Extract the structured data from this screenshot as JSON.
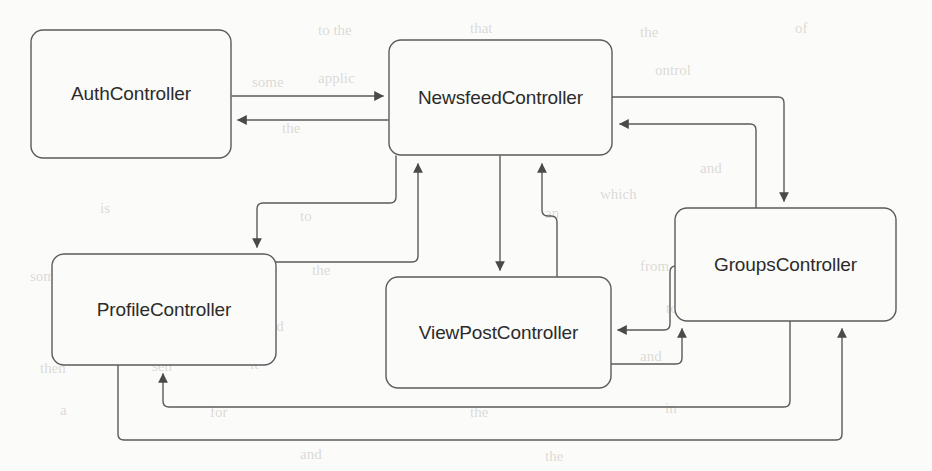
{
  "diagram": {
    "type": "flow-diagram",
    "canvas": {
      "width": 932,
      "height": 471,
      "background": "#fbfbf9"
    },
    "style": {
      "node_fill": "#fbfbf9",
      "node_stroke": "#5b5b5b",
      "edge_stroke": "#5b5b5b",
      "text_color": "#2b2b2b",
      "corner_radius": 12
    },
    "nodes": [
      {
        "id": "auth",
        "label": "AuthController",
        "x": 31,
        "y": 30,
        "w": 200,
        "h": 128
      },
      {
        "id": "newsfeed",
        "label": "NewsfeedController",
        "x": 389,
        "y": 40,
        "w": 223,
        "h": 115
      },
      {
        "id": "groups",
        "label": "GroupsController",
        "x": 675,
        "y": 208,
        "w": 221,
        "h": 113
      },
      {
        "id": "profile",
        "label": "ProfileController",
        "x": 52,
        "y": 254,
        "w": 224,
        "h": 111
      },
      {
        "id": "viewpost",
        "label": "ViewPostController",
        "x": 386,
        "y": 277,
        "w": 225,
        "h": 111
      }
    ],
    "edges": [
      {
        "id": "auth-to-newsfeed",
        "from": "auth",
        "to": "newsfeed",
        "path": "M 232 96 L 383 96",
        "arrow_at": "end"
      },
      {
        "id": "newsfeed-to-auth",
        "from": "newsfeed",
        "to": "auth",
        "path": "M 388 120 L 238 120",
        "arrow_at": "end"
      },
      {
        "id": "newsfeed-to-profile",
        "from": "newsfeed",
        "to": "profile",
        "path": "M 396 156 L 396 197 Q 396 203 390 203 L 263 203 Q 257 203 257 209 L 257 247",
        "arrow_at": "end"
      },
      {
        "id": "profile-to-newsfeed",
        "from": "profile",
        "to": "newsfeed",
        "path": "M 276 262 L 412 262 Q 418 262 418 256 L 418 164",
        "arrow_at": "end"
      },
      {
        "id": "newsfeed-to-viewpost",
        "from": "newsfeed",
        "to": "viewpost",
        "path": "M 500 156 L 500 270",
        "arrow_at": "end"
      },
      {
        "id": "viewpost-to-newsfeed",
        "from": "viewpost",
        "to": "newsfeed",
        "path": "M 557 277 L 557 222 Q 557 216 551 216 L 548 216 Q 542 216 542 210 L 542 164",
        "arrow_at": "end"
      },
      {
        "id": "newsfeed-to-groups",
        "from": "newsfeed",
        "to": "groups",
        "path": "M 612 97 L 778 97 Q 784 97 784 103 L 784 201",
        "arrow_at": "end"
      },
      {
        "id": "groups-to-newsfeed",
        "from": "groups",
        "to": "newsfeed",
        "path": "M 756 208 L 756 130 Q 756 124 750 124 L 620 124",
        "arrow_at": "end"
      },
      {
        "id": "groups-to-viewpost",
        "from": "groups",
        "to": "viewpost",
        "path": "M 676 266 Q 670 266 670 272 L 670 324 Q 670 330 664 330 L 618 330",
        "arrow_at": "end"
      },
      {
        "id": "viewpost-to-groups",
        "from": "viewpost",
        "to": "groups",
        "path": "M 611 364 L 676 364 Q 682 364 682 358 L 682 329",
        "arrow_at": "end"
      },
      {
        "id": "groups-to-profile",
        "from": "groups",
        "to": "profile",
        "path": "M 790 321 L 790 401 Q 790 407 784 407 L 169 407 Q 163 407 163 401 L 163 374",
        "arrow_at": "end"
      },
      {
        "id": "profile-to-groups",
        "from": "profile",
        "to": "groups",
        "path": "M 118 365 L 118 434 Q 118 440 124 440 L 836 440 Q 842 440 842 434 L 842 329",
        "arrow_at": "end"
      }
    ],
    "background_text": [
      {
        "t": "to the",
        "x": 318,
        "y": 22
      },
      {
        "t": "that",
        "x": 470,
        "y": 20
      },
      {
        "t": "the",
        "x": 640,
        "y": 24
      },
      {
        "t": "of",
        "x": 795,
        "y": 20
      },
      {
        "t": "some",
        "x": 252,
        "y": 74
      },
      {
        "t": "applic",
        "x": 318,
        "y": 70
      },
      {
        "t": "a num",
        "x": 470,
        "y": 68
      },
      {
        "t": "ontrol",
        "x": 655,
        "y": 62
      },
      {
        "t": "the",
        "x": 282,
        "y": 120
      },
      {
        "t": "user",
        "x": 430,
        "y": 118
      },
      {
        "t": "the",
        "x": 560,
        "y": 114
      },
      {
        "t": "and",
        "x": 700,
        "y": 160
      },
      {
        "t": "is",
        "x": 100,
        "y": 200
      },
      {
        "t": "to",
        "x": 300,
        "y": 208
      },
      {
        "t": "an",
        "x": 545,
        "y": 205
      },
      {
        "t": "which",
        "x": 600,
        "y": 186
      },
      {
        "t": "some",
        "x": 30,
        "y": 268
      },
      {
        "t": "the",
        "x": 312,
        "y": 262
      },
      {
        "t": "from",
        "x": 640,
        "y": 258
      },
      {
        "t": "the",
        "x": 108,
        "y": 312
      },
      {
        "t": "sh",
        "x": 200,
        "y": 318
      },
      {
        "t": "and",
        "x": 262,
        "y": 318
      },
      {
        "t": "to",
        "x": 666,
        "y": 300
      },
      {
        "t": "the",
        "x": 760,
        "y": 300
      },
      {
        "t": "then",
        "x": 40,
        "y": 360
      },
      {
        "t": "sen",
        "x": 152,
        "y": 358
      },
      {
        "t": "it",
        "x": 250,
        "y": 356
      },
      {
        "t": "and",
        "x": 640,
        "y": 348
      },
      {
        "t": "a",
        "x": 60,
        "y": 402
      },
      {
        "t": "for",
        "x": 210,
        "y": 404
      },
      {
        "t": "the",
        "x": 470,
        "y": 404
      },
      {
        "t": "in",
        "x": 665,
        "y": 400
      },
      {
        "t": "and",
        "x": 300,
        "y": 446
      },
      {
        "t": "the",
        "x": 545,
        "y": 448
      }
    ]
  }
}
